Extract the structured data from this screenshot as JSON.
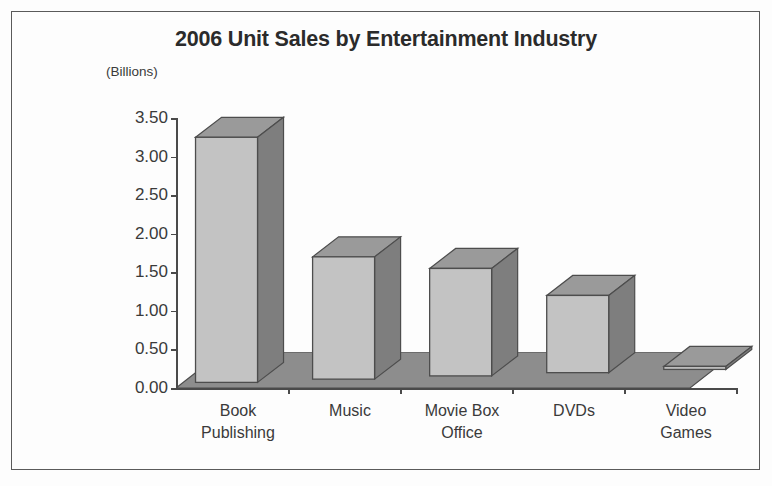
{
  "chart_data": {
    "type": "bar",
    "title": "2006 Unit Sales by Entertainment Industry",
    "ylabel": "(Billions)",
    "xlabel": "",
    "categories": [
      "Book Publishing",
      "Music",
      "Movie Box Office",
      "DVDs",
      "Video Games"
    ],
    "values": [
      3.25,
      1.7,
      1.55,
      1.2,
      0.28
    ],
    "ylim": [
      0.0,
      3.5
    ],
    "ytick_labels": [
      "0.00",
      "0.50",
      "1.00",
      "1.50",
      "2.00",
      "2.50",
      "3.00",
      "3.50"
    ],
    "ytick_values": [
      0.0,
      0.5,
      1.0,
      1.5,
      2.0,
      2.5,
      3.0,
      3.5
    ],
    "grid": false,
    "legend": false,
    "style": "3d-column",
    "colors": {
      "bar_front": "#c3c3c3",
      "bar_side": "#7e7e7e",
      "bar_top": "#9a9a9a",
      "floor": "#8d8d8d",
      "axis": "#4a4a4a",
      "text": "#3a3a3a",
      "background": "#fdfdfd",
      "border": "#5a5a5a"
    }
  },
  "categories_multiline": [
    [
      "Book",
      "Publishing"
    ],
    [
      "Music",
      ""
    ],
    [
      "Movie Box",
      "Office"
    ],
    [
      "DVDs",
      ""
    ],
    [
      "Video",
      "Games"
    ]
  ]
}
